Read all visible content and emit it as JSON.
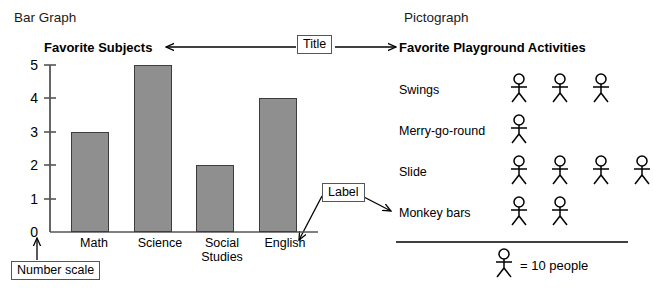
{
  "panels": {
    "left_heading": "Bar Graph",
    "right_heading": "Pictograph"
  },
  "callouts": {
    "title": "Title",
    "label": "Label",
    "number_scale": "Number scale"
  },
  "bar_graph": {
    "title": "Favorite Subjects"
  },
  "pictograph": {
    "title": "Favorite Playground Activities",
    "key_text": "= 10 people",
    "rows": [
      {
        "label": "Swings",
        "count": 3
      },
      {
        "label": "Merry-go-round",
        "count": 1
      },
      {
        "label": "Slide",
        "count": 4
      },
      {
        "label": "Monkey bars",
        "count": 2
      }
    ]
  },
  "chart_data": {
    "type": "bar",
    "title": "Favorite Subjects",
    "categories": [
      "Math",
      "Science",
      "Social Studies",
      "English"
    ],
    "values": [
      3,
      5,
      2,
      4
    ],
    "xlabel": "",
    "ylabel": "",
    "ylim": [
      0,
      5
    ],
    "yticks": [
      0,
      1,
      2,
      3,
      4,
      5
    ],
    "grid": false,
    "legend": false,
    "bar_color": "#8f8f8f",
    "bar_border_color": "#3d3d3d"
  }
}
